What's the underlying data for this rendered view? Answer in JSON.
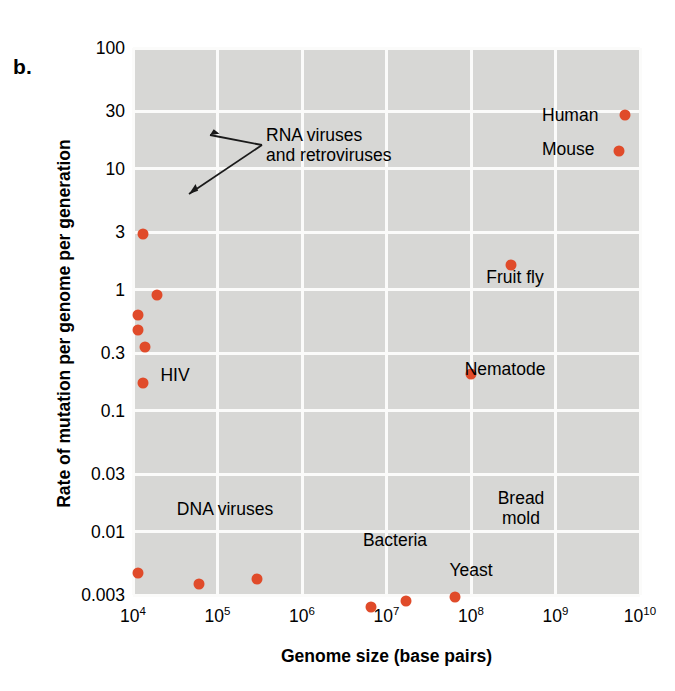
{
  "panel": {
    "letter": "b."
  },
  "axes": {
    "x_title": "Genome size (base pairs)",
    "y_title": "Rate of mutation per genome per generation",
    "x_ticks": [
      {
        "mantissa": "10",
        "exp": "4"
      },
      {
        "mantissa": "10",
        "exp": "5"
      },
      {
        "mantissa": "10",
        "exp": "6"
      },
      {
        "mantissa": "10",
        "exp": "7"
      },
      {
        "mantissa": "10",
        "exp": "8"
      },
      {
        "mantissa": "10",
        "exp": "9"
      },
      {
        "mantissa": "10",
        "exp": "10"
      }
    ],
    "y_ticks": [
      "100",
      "30",
      "10",
      "3",
      "1",
      "0.3",
      "0.1",
      "0.03",
      "0.01",
      "0.003"
    ]
  },
  "labels": {
    "rna_viruses_line1": "RNA viruses",
    "rna_viruses_line2": "and retroviruses",
    "hiv": "HIV",
    "human": "Human",
    "mouse": "Mouse",
    "fruit_fly": "Fruit fly",
    "nematode": "Nematode",
    "dna_viruses": "DNA viruses",
    "bacteria": "Bacteria",
    "yeast": "Yeast",
    "bread_mold_line1": "Bread",
    "bread_mold_line2": "mold"
  },
  "style": {
    "point_color": "#e04b2a",
    "plot_background": "#d7d7d5",
    "gridline_color": "#fbfbfa"
  },
  "chart_data": {
    "type": "scatter",
    "title": "",
    "xlabel": "Genome size (base pairs)",
    "ylabel": "Rate of mutation per genome per generation",
    "xscale": "log",
    "yscale": "log",
    "xlim": [
      10000,
      10000000000
    ],
    "ylim": [
      0.003,
      100
    ],
    "grid": true,
    "legend": "none",
    "xtick_values": [
      10000,
      100000,
      1000000,
      10000000,
      100000000,
      1000000000,
      10000000000
    ],
    "ytick_values": [
      100,
      30,
      10,
      3,
      1,
      0.3,
      0.1,
      0.03,
      0.01,
      0.003
    ],
    "points": [
      {
        "label": "RNA virus",
        "x": 13000,
        "y": 2.9,
        "group": "RNA viruses and retroviruses"
      },
      {
        "label": "RNA virus",
        "x": 19000,
        "y": 0.9,
        "group": "RNA viruses and retroviruses"
      },
      {
        "label": "RNA virus",
        "x": 11500,
        "y": 0.62,
        "group": "RNA viruses and retroviruses"
      },
      {
        "label": "RNA virus",
        "x": 11500,
        "y": 0.47,
        "group": "RNA viruses and retroviruses"
      },
      {
        "label": "RNA virus",
        "x": 14000,
        "y": 0.34,
        "group": "RNA viruses and retroviruses"
      },
      {
        "label": "HIV",
        "x": 13000,
        "y": 0.17,
        "group": "retrovirus"
      },
      {
        "label": "DNA virus",
        "x": 11500,
        "y": 0.0046,
        "group": "DNA viruses"
      },
      {
        "label": "DNA virus",
        "x": 60000,
        "y": 0.0037,
        "group": "DNA viruses"
      },
      {
        "label": "DNA virus",
        "x": 290000,
        "y": 0.0041,
        "group": "DNA viruses"
      },
      {
        "label": "Bacteria",
        "x": 6500000,
        "y": 0.0024,
        "group": "Bacteria"
      },
      {
        "label": "Yeast",
        "x": 17000000,
        "y": 0.0027,
        "group": "Yeast"
      },
      {
        "label": "Bread mold",
        "x": 65000000,
        "y": 0.0029,
        "group": "Bread mold"
      },
      {
        "label": "Nematode",
        "x": 100000000,
        "y": 0.2,
        "group": "Nematode"
      },
      {
        "label": "Fruit fly",
        "x": 300000000,
        "y": 1.6,
        "group": "Fruit fly"
      },
      {
        "label": "Mouse",
        "x": 5600000000,
        "y": 14,
        "group": "Mouse"
      },
      {
        "label": "Human",
        "x": 6600000000,
        "y": 28,
        "group": "Human"
      }
    ],
    "annotations": [
      "RNA viruses and retroviruses",
      "HIV",
      "DNA viruses",
      "Bacteria",
      "Yeast",
      "Bread mold",
      "Nematode",
      "Fruit fly",
      "Mouse",
      "Human"
    ]
  }
}
